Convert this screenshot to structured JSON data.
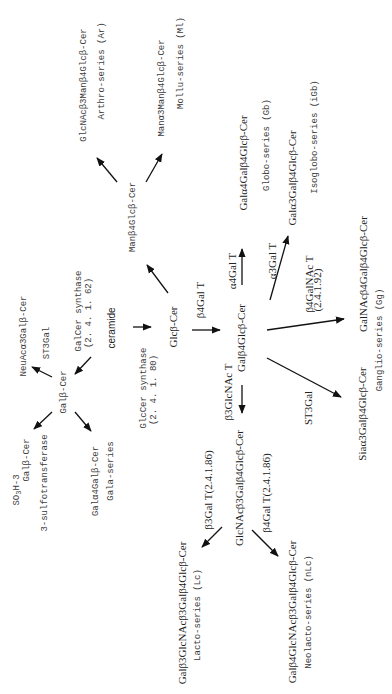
{
  "diagram": {
    "substrate": "ceramide",
    "nodes": {
      "glccer": "Glcβ-Cer",
      "galcer": "Galβ-Cer",
      "lactosylcer": "Galβ4Glcβ-Cer",
      "manglccer": "Manβ4Glcβ-Cer",
      "arthro_core": "GlcNAcβ3Manβ4Glcβ-Cer",
      "mollu_core": "Manα3Manβ4Glcβ-Cer",
      "globo_core": "Galα4Galβ4Glcβ-Cer",
      "isoglobo_core": "Galα3Galβ4Glcβ-Cer",
      "ganglio_core": "GalNAcβ4Galβ4Glcβ-Cer",
      "sialyl_lactosylcer": "Siaα3Galβ4Glcβ-Cer",
      "lactotriaosylcer": "GlcNAcβ3Galβ4Glcβ-Cer",
      "lacto_core": "Galβ3GlcNAcβ3Galβ4Glcβ-Cer",
      "neolacto_core": "Galβ4GlcNAcβ3Galβ4Glcβ-Cer",
      "neuac_galcer": "NeuAcα3Galβ-Cer",
      "sulfo_prefix_a": "SO",
      "sulfo_prefix_sub": "3",
      "sulfo_prefix_b": "H-3",
      "sulfo_galcer": "Galβ-Cer",
      "gala_core": "Galα4Galβ-Cer"
    },
    "series": {
      "arthro": "Arthro-series (Ar)",
      "mollu": "Mollu-series (Ml)",
      "globo": "Globo-series (Gb)",
      "isoglobo": "Isoglobo-series (iGb)",
      "ganglio": "Ganglio-series (Gg)",
      "lacto": "Lacto-series (Lc)",
      "neolacto": "Neolacto-series (nLc)",
      "gala": "Gala-series"
    },
    "enzymes": {
      "galcer_synthase": "GalCer synthase",
      "galcer_synthase_ec": "(2. 4. 1. 62)",
      "glccer_synthase": "GlcCer synthase",
      "glccer_synthase_ec": "(2. 4. 1. 80)",
      "st3gal_left": "ST3Gal",
      "sulfotransferase": "3-sulfotransferase",
      "b4galt": "β4Gal  T",
      "a4galt": "α4Gal T",
      "a3galt": "α3Gal T",
      "b4galnact": "β4GalNAc T",
      "b4galnact_ec": "(2.4.1.92)",
      "st3gal_right": "ST3Gal",
      "b3glcnact": "β3GlcNAc T",
      "b3galt": "β3Gal T(2.4.1.86)",
      "b4galt_ec": "β4Gal T(2.4.1.86)"
    },
    "colors": {
      "text": "#222222",
      "mono_text": "#3c3c3c",
      "arrow": "#111111",
      "background": "#ffffff"
    }
  }
}
